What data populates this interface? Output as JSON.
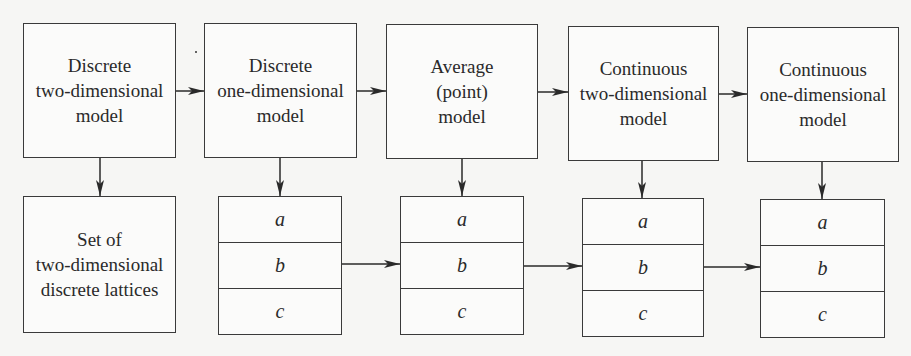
{
  "diagram": {
    "top_models": [
      {
        "lines": [
          "Discrete",
          "two-dimensional",
          "model"
        ]
      },
      {
        "lines": [
          "Discrete",
          "one-dimensional",
          "model"
        ]
      },
      {
        "lines": [
          "Average",
          "(point)",
          "model"
        ]
      },
      {
        "lines": [
          "Continuous",
          "two-dimensional",
          "model"
        ]
      },
      {
        "lines": [
          "Continuous",
          "one-dimensional",
          "model"
        ]
      }
    ],
    "lattice_box": {
      "lines": [
        "Set of",
        "two-dimensional",
        "discrete lattices"
      ]
    },
    "stacks": [
      {
        "cells": [
          "a",
          "b",
          "c"
        ]
      },
      {
        "cells": [
          "a",
          "b",
          "c"
        ]
      },
      {
        "cells": [
          "a",
          "b",
          "c"
        ]
      },
      {
        "cells": [
          "a",
          "b",
          "c"
        ]
      }
    ]
  }
}
